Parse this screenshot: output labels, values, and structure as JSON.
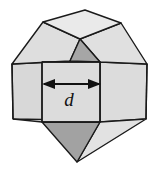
{
  "figure": {
    "shape_name": "truncated-octahedron",
    "dimension_label": "d",
    "colors": {
      "face_light": "#dedede",
      "face_light_2": "#d6d6d6",
      "face_light_3": "#e4e4e4",
      "face_top": "#e8e8e8",
      "face_shaded": "#a6a6a6",
      "face_shaded_dark": "#9a9a9a",
      "edge": "#1a1a1a",
      "arrow": "#111111",
      "background": "#ffffff"
    },
    "annotation": {
      "arrow_name": "width-dimension-arrow",
      "arrow_x_start": 42,
      "arrow_x_end": 101,
      "arrow_y": 84,
      "label_x": 69,
      "label_y": 106
    },
    "geometry": {
      "top_face": "43,22 85,10 121,23 80,39",
      "upper_left_face": "12,64 43,22 80,39 70,61",
      "upper_right_face": "80,39 121,23 147,64 100,62",
      "shaded_upper_face": "70,61 80,39 100,62",
      "left_face": "12,64 70,61 70,120 13,119",
      "front_face": "42,62 100,62 100,122 42,122",
      "right_face": "100,62 147,64 146,119 100,122",
      "shaded_bottom_face": "42,122 100,122 77,162",
      "bottom_right_face": "100,122 146,119 77,162"
    }
  }
}
